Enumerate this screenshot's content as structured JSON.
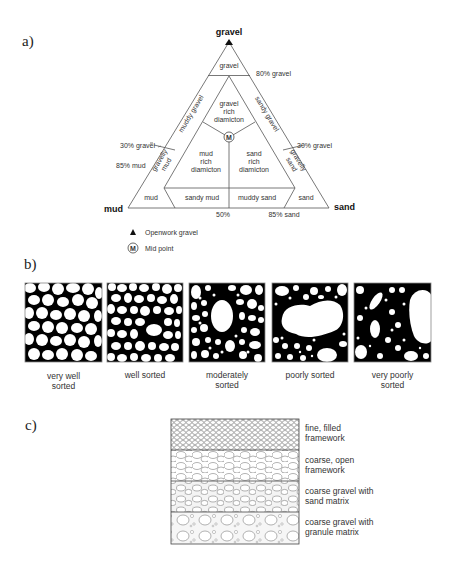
{
  "panels": {
    "a_label": "a)",
    "b_label": "b)",
    "c_label": "c)"
  },
  "ternary": {
    "apex_labels": {
      "top": "gravel",
      "left": "mud",
      "right": "sand"
    },
    "regions": {
      "gravel": "gravel",
      "muddy_gravel": "muddy gravel",
      "sandy_gravel": "sandy gravel",
      "gravel_rich_diamicton": [
        "gravel",
        "rich",
        "diamicton"
      ],
      "mud_rich_diamicton": [
        "mud",
        "rich",
        "diamicton"
      ],
      "sand_rich_diamicton": [
        "sand",
        "rich",
        "diamicton"
      ],
      "gravelly_mud": [
        "gravelly",
        "mud"
      ],
      "gravelly_sand": [
        "gravelly",
        "sand"
      ],
      "mud": "mud",
      "sandy_mud": "sandy mud",
      "muddy_sand": "muddy sand",
      "sand": "sand"
    },
    "boundaries": {
      "gravel_80": "80% gravel",
      "gravel_30_left": "30% gravel",
      "gravel_30_right": "30% gravel",
      "mud_85": "85% mud",
      "mid_50": "50%",
      "sand_85": "85% sand"
    },
    "midpoint_symbol": "M",
    "legend": [
      {
        "icon": "filled-triangle-icon",
        "label": "Openwork gravel"
      },
      {
        "icon": "circled-m-icon",
        "symbol": "M",
        "label": "Mid point"
      }
    ]
  },
  "sorting": {
    "captions": [
      [
        "very well",
        "sorted"
      ],
      [
        "well sorted"
      ],
      [
        "moderately",
        "sorted"
      ],
      [
        "poorly sorted"
      ],
      [
        "very poorly",
        "sorted"
      ]
    ]
  },
  "framework": {
    "layers": [
      [
        "fine, filled",
        "framework"
      ],
      [
        "coarse, open",
        "framework"
      ],
      [
        "coarse gravel with",
        "sand matrix"
      ],
      [
        "coarse gravel with",
        "granule matrix"
      ]
    ]
  }
}
